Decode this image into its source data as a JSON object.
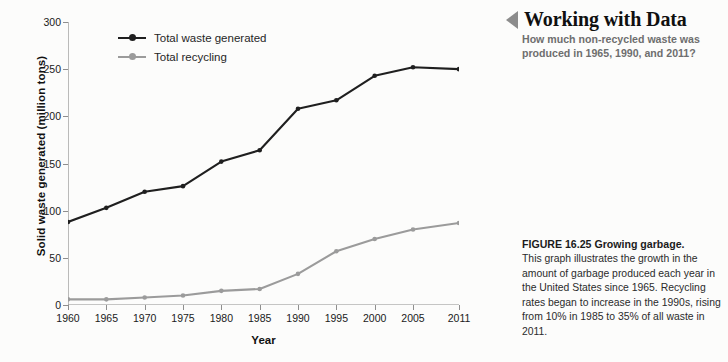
{
  "panel": {
    "header_title": "Working with Data",
    "header_icon": "left-triangle-icon",
    "question": "How much non-recycled waste was produced in 1965, 1990, and 2011?",
    "caption_title": "FIGURE 16.25 Growing garbage.",
    "caption_body": "This graph illustrates the growth in the amount of garbage produced each year in the United States since 1965. Recycling rates began to increase in the 1990s, rising from 10% in 1985 to 35% of all waste in 2011."
  },
  "colors": {
    "waste_line": "#1f1f1f",
    "recycling_line": "#9b9b9b",
    "axis": "#8e8e8e",
    "header_triangle": "#8c8c8c",
    "question_text": "#6e6e6e",
    "background": "#fcfcfb"
  },
  "chart_data": {
    "type": "line",
    "title": "",
    "xlabel": "Year",
    "ylabel": "Solid waste generated (million tons)",
    "x": [
      1960,
      1965,
      1970,
      1975,
      1980,
      1985,
      1990,
      1995,
      2000,
      2005,
      2011
    ],
    "categories": [
      "1960",
      "1965",
      "1970",
      "1975",
      "1980",
      "1985",
      "1990",
      "1995",
      "2000",
      "2005",
      "2011"
    ],
    "xtick_labels": [
      "1960",
      "1965",
      "1970",
      "1975",
      "1980",
      "1985",
      "1990",
      "1995",
      "2000",
      "2005",
      "2011"
    ],
    "ytick_labels": [
      "0",
      "50",
      "100",
      "150",
      "200",
      "250",
      "300"
    ],
    "yticks": [
      0,
      50,
      100,
      150,
      200,
      250,
      300
    ],
    "ylim": [
      0,
      300
    ],
    "xlim": [
      1960,
      2011
    ],
    "grid": false,
    "legend_position": "top-left",
    "series": [
      {
        "name": "Total waste generated",
        "color": "#1f1f1f",
        "values": [
          88,
          103,
          120,
          126,
          152,
          164,
          208,
          217,
          243,
          252,
          250
        ]
      },
      {
        "name": "Total recycling",
        "color": "#9b9b9b",
        "values": [
          6,
          6,
          8,
          10,
          15,
          17,
          33,
          57,
          70,
          80,
          87
        ]
      }
    ]
  }
}
